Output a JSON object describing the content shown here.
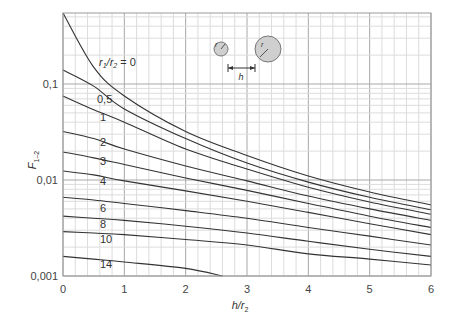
{
  "chart_data": {
    "type": "line",
    "title": "",
    "xlabel": "h/r2",
    "ylabel": "F1-2",
    "xscale": "linear",
    "yscale": "log",
    "xlim": [
      0,
      6
    ],
    "ylim": [
      0.001,
      0.55
    ],
    "grid": true,
    "x_ticks": [
      "0",
      "1",
      "2",
      "3",
      "4",
      "5",
      "6"
    ],
    "y_ticks": [
      "0,001",
      "0,01",
      "0,1"
    ],
    "legend_title": "r1/r2 = 0",
    "annotation": "Inset sketch: small circle r1, large circle r2, separated by distance h",
    "x": [
      0,
      0.5,
      1,
      2,
      3,
      4,
      5,
      6
    ],
    "series": [
      {
        "name": "0",
        "values": [
          0.55,
          0.15,
          0.075,
          0.032,
          0.018,
          0.011,
          0.0075,
          0.0055
        ]
      },
      {
        "name": "0.5",
        "values": [
          0.14,
          0.095,
          0.055,
          0.027,
          0.015,
          0.0095,
          0.0066,
          0.0049
        ]
      },
      {
        "name": "1",
        "values": [
          0.075,
          0.054,
          0.04,
          0.021,
          0.013,
          0.0084,
          0.0059,
          0.0044
        ]
      },
      {
        "name": "2",
        "values": [
          0.032,
          0.027,
          0.021,
          0.014,
          0.0098,
          0.0068,
          0.005,
          0.0038
        ]
      },
      {
        "name": "3",
        "values": [
          0.0196,
          0.017,
          0.0145,
          0.0105,
          0.0078,
          0.0057,
          0.0042,
          0.0032
        ]
      },
      {
        "name": "4",
        "values": [
          0.0124,
          0.0113,
          0.0098,
          0.0077,
          0.006,
          0.0046,
          0.0035,
          0.0027
        ]
      },
      {
        "name": "6",
        "values": [
          0.0066,
          0.0062,
          0.0057,
          0.0048,
          0.004,
          0.0032,
          0.0026,
          0.0021
        ]
      },
      {
        "name": "8",
        "values": [
          0.0042,
          0.004,
          0.0038,
          0.0033,
          0.0028,
          0.0023,
          0.0019,
          0.0016
        ]
      },
      {
        "name": "10",
        "values": [
          0.0029,
          0.0028,
          0.0027,
          0.0024,
          0.0021,
          0.0017,
          0.0015,
          0.0013
        ]
      },
      {
        "name": "14",
        "values": [
          0.0016,
          0.0015,
          0.0014,
          0.0012,
          null,
          null,
          null,
          null
        ]
      }
    ]
  },
  "labels": {
    "ytick_0001": "0,001",
    "ytick_001": "0,01",
    "ytick_01": "0,1",
    "legend_prefix": "r",
    "legend_suffix": " = 0",
    "curve_labels": [
      "0,5",
      "1",
      "2",
      "3",
      "4",
      "6",
      "8",
      "10",
      "14"
    ],
    "ylabel_main": "F",
    "ylabel_sub": "1–2",
    "xlabel_main": "h/r",
    "xlabel_sub": "2",
    "inset_h": "h",
    "inset_r1": "r",
    "inset_r2": "r"
  }
}
